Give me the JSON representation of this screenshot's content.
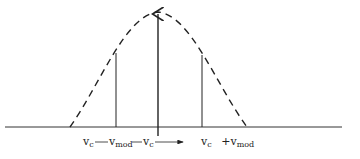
{
  "diagram": {
    "type": "AM frequency spectrum",
    "labels": {
      "lower_sideband": {
        "base": "v",
        "sub": "c",
        "connector": "—",
        "mod_base": "v",
        "mod_sub": "mod"
      },
      "carrier": {
        "base": "v",
        "sub": "c"
      },
      "upper_sideband": {
        "base": "v",
        "sub": "c",
        "plus": "+",
        "mod_base": "v",
        "mod_sub": "mod"
      }
    },
    "components": [
      {
        "name": "lower-sideband",
        "relative_amplitude": 0.64
      },
      {
        "name": "carrier",
        "relative_amplitude": 1.0
      },
      {
        "name": "upper-sideband",
        "relative_amplitude": 0.62
      }
    ],
    "colors": {
      "line": "#222222",
      "axis": "#333333"
    }
  }
}
